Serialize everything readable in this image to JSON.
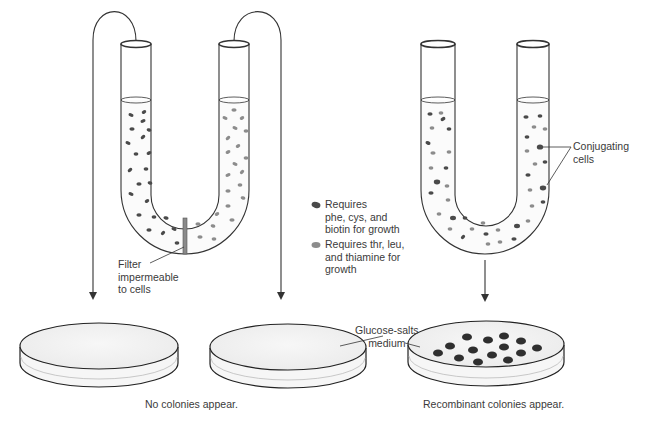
{
  "colors": {
    "dark_cell": "#4a4a4a",
    "light_cell": "#8c8c8c",
    "colony": "#2f2f2f",
    "outline": "#333333",
    "filter": "#7a7a7a",
    "medium": "#f2f2f2"
  },
  "legend": {
    "items": [
      {
        "icon": "dark-cell-icon",
        "text": "Requires\nphe, cys, and\nbiotin for growth"
      },
      {
        "icon": "light-cell-icon",
        "text": "Requires thr, leu,\nand thiamine for\ngrowth"
      }
    ]
  },
  "labels": {
    "filter": "Filter\nimpermeable\nto cells",
    "conjugating": "Conjugating\ncells",
    "medium": "Glucose-salts\nmedium",
    "no_colonies": "No colonies appear.",
    "recombinant": "Recombinant colonies appear."
  }
}
